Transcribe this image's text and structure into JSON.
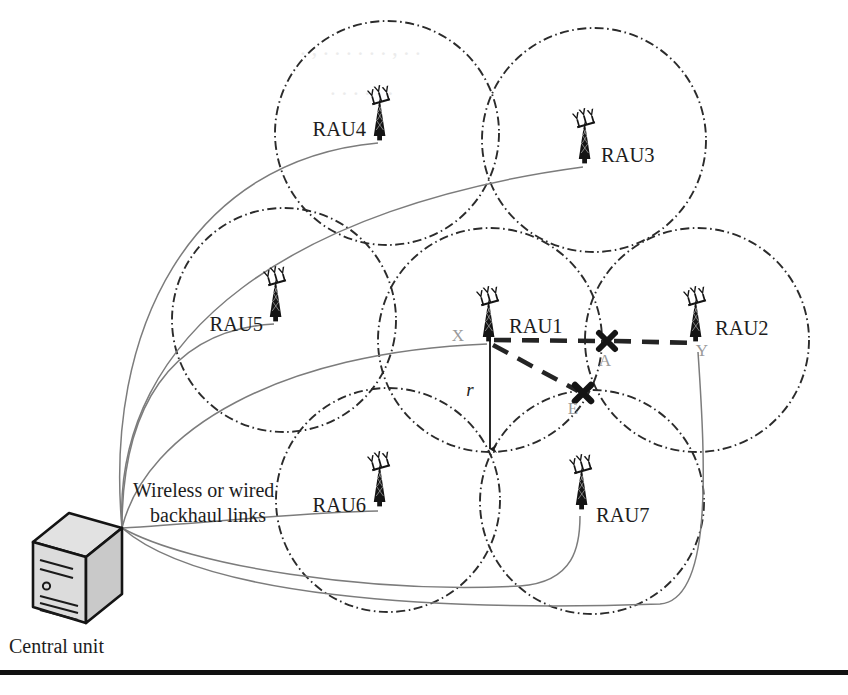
{
  "figure": {
    "caption_lines": [
      "Wireless or wired",
      "backhaul links"
    ],
    "central_unit_label": "Central unit",
    "radius_label": "r"
  },
  "colors": {
    "cell_stroke": "#2b2b2b",
    "backhaul_stroke": "#7c7c7c",
    "dashed_link": "#242424",
    "tower_fill": "#141414",
    "point_label": "#9a9a9a",
    "text": "#1d1d1d",
    "background": "#ffffff",
    "rule": "#111111"
  },
  "rau_nodes": [
    {
      "id": "rau1",
      "label": "RAU1",
      "cx": 490,
      "cy": 340,
      "label_x": 509,
      "label_y": 327,
      "label_anchor": "start",
      "cell_cx": 490,
      "cell_cy": 340,
      "cell_r": 112
    },
    {
      "id": "rau2",
      "label": "RAU2",
      "cx": 697,
      "cy": 340,
      "label_x": 714,
      "label_y": 329,
      "label_anchor": "start",
      "cell_cx": 697,
      "cell_cy": 340,
      "cell_r": 112
    },
    {
      "id": "rau3",
      "label": "RAU3",
      "cx": 586,
      "cy": 162,
      "label_x": 601,
      "label_y": 156,
      "label_anchor": "start",
      "cell_cx": 594,
      "cell_cy": 140,
      "cell_r": 112
    },
    {
      "id": "rau4",
      "label": "RAU4",
      "cx": 381,
      "cy": 139,
      "label_x": 368,
      "label_y": 130,
      "label_anchor": "end",
      "cell_cx": 387,
      "cell_cy": 133,
      "cell_r": 112
    },
    {
      "id": "rau5",
      "label": "RAU5",
      "cx": 277,
      "cy": 320,
      "label_x": 265,
      "label_y": 327,
      "label_anchor": "end",
      "cell_cx": 284,
      "cell_cy": 320,
      "cell_r": 112
    },
    {
      "id": "rau6",
      "label": "RAU6",
      "cx": 381,
      "cy": 505,
      "label_x": 368,
      "label_y": 507,
      "label_anchor": "end",
      "cell_cx": 388,
      "cell_cy": 500,
      "cell_r": 112
    },
    {
      "id": "rau7",
      "label": "RAU7",
      "cx": 583,
      "cy": 508,
      "label_x": 597,
      "label_y": 516,
      "label_anchor": "start",
      "cell_cx": 592,
      "cell_cy": 502,
      "cell_r": 112
    }
  ],
  "points": [
    {
      "id": "X",
      "label": "X",
      "x": 465,
      "y": 333,
      "label_x": 458,
      "label_y": 340,
      "marker": false
    },
    {
      "id": "A",
      "label": "A",
      "x": 607,
      "y": 342,
      "label_x": 603,
      "label_y": 364,
      "marker": true
    },
    {
      "id": "Y",
      "label": "Y",
      "x": 698,
      "y": 345,
      "label_x": 700,
      "label_y": 356,
      "marker": false
    },
    {
      "id": "E",
      "label": "E",
      "x": 583,
      "y": 393,
      "label_x": 572,
      "label_y": 412,
      "marker": true
    }
  ],
  "links": {
    "dashed": [
      {
        "id": "x-to-a",
        "from": "X",
        "to": "A"
      },
      {
        "id": "a-to-y",
        "from": "A",
        "to": "Y"
      },
      {
        "id": "x-to-e",
        "from": "X",
        "to": "E"
      }
    ],
    "backhaul_count": 7,
    "backhaul_origin": {
      "x": 122,
      "y": 528
    }
  },
  "central_unit": {
    "label": "Central unit",
    "x": 30,
    "y": 513,
    "width": 92,
    "height": 110,
    "label_x": 12,
    "label_y": 652
  },
  "radius_arrow": {
    "label": "r",
    "from_x": 490,
    "from_y": 340,
    "to_x": 490,
    "to_y": 453,
    "label_x": 470,
    "label_y": 396
  },
  "bottom_rule": {
    "x": 0,
    "y": 670,
    "width": 848,
    "height": 5
  }
}
